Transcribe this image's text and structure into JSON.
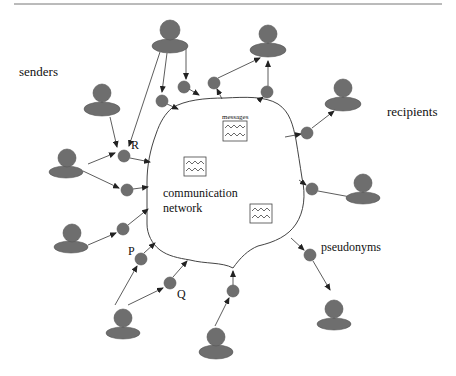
{
  "diagram": {
    "title_rule": true,
    "labels": {
      "senders": "senders",
      "recipients": "recipients",
      "messages": "messages",
      "network_line1": "communication",
      "network_line2": "network",
      "pseudonyms": "pseudonyms",
      "R": "R",
      "P": "P",
      "Q": "Q"
    },
    "colors": {
      "node_fill": "#6e6e6e",
      "line": "#333333",
      "background": "#ffffff"
    },
    "senders": [
      {
        "id": "s-top",
        "x": 170,
        "y": 30
      },
      {
        "id": "s-leftmid",
        "x": 102,
        "y": 93
      },
      {
        "id": "s-left",
        "x": 66,
        "y": 158
      },
      {
        "id": "s-leftlow",
        "x": 71,
        "y": 233
      },
      {
        "id": "s-bottomleft",
        "x": 123,
        "y": 317
      },
      {
        "id": "s-bottom",
        "x": 216,
        "y": 336
      }
    ],
    "recipients": [
      {
        "id": "r-top",
        "x": 268,
        "y": 36
      },
      {
        "id": "r-right",
        "x": 343,
        "y": 89
      },
      {
        "id": "r-rightmid",
        "x": 363,
        "y": 183
      },
      {
        "id": "r-bottomright",
        "x": 334,
        "y": 309
      }
    ],
    "pseudonyms": [
      {
        "id": "p1",
        "x": 162,
        "y": 101
      },
      {
        "id": "p2",
        "x": 184,
        "y": 87
      },
      {
        "id": "p3",
        "x": 214,
        "y": 83
      },
      {
        "id": "p4",
        "x": 267,
        "y": 92
      },
      {
        "id": "R",
        "x": 124,
        "y": 156
      },
      {
        "id": "p6",
        "x": 127,
        "y": 190
      },
      {
        "id": "p7",
        "x": 123,
        "y": 229
      },
      {
        "id": "P",
        "x": 141,
        "y": 259
      },
      {
        "id": "Q",
        "x": 170,
        "y": 283
      },
      {
        "id": "p10",
        "x": 233,
        "y": 291
      },
      {
        "id": "p11",
        "x": 308,
        "y": 133
      },
      {
        "id": "p12",
        "x": 312,
        "y": 189
      },
      {
        "id": "p13",
        "x": 310,
        "y": 255
      }
    ],
    "messages": [
      {
        "x": 223,
        "y": 121,
        "w": 24,
        "h": 20
      },
      {
        "x": 184,
        "y": 157,
        "w": 22,
        "h": 19
      },
      {
        "x": 250,
        "y": 204,
        "w": 22,
        "h": 19
      }
    ]
  }
}
